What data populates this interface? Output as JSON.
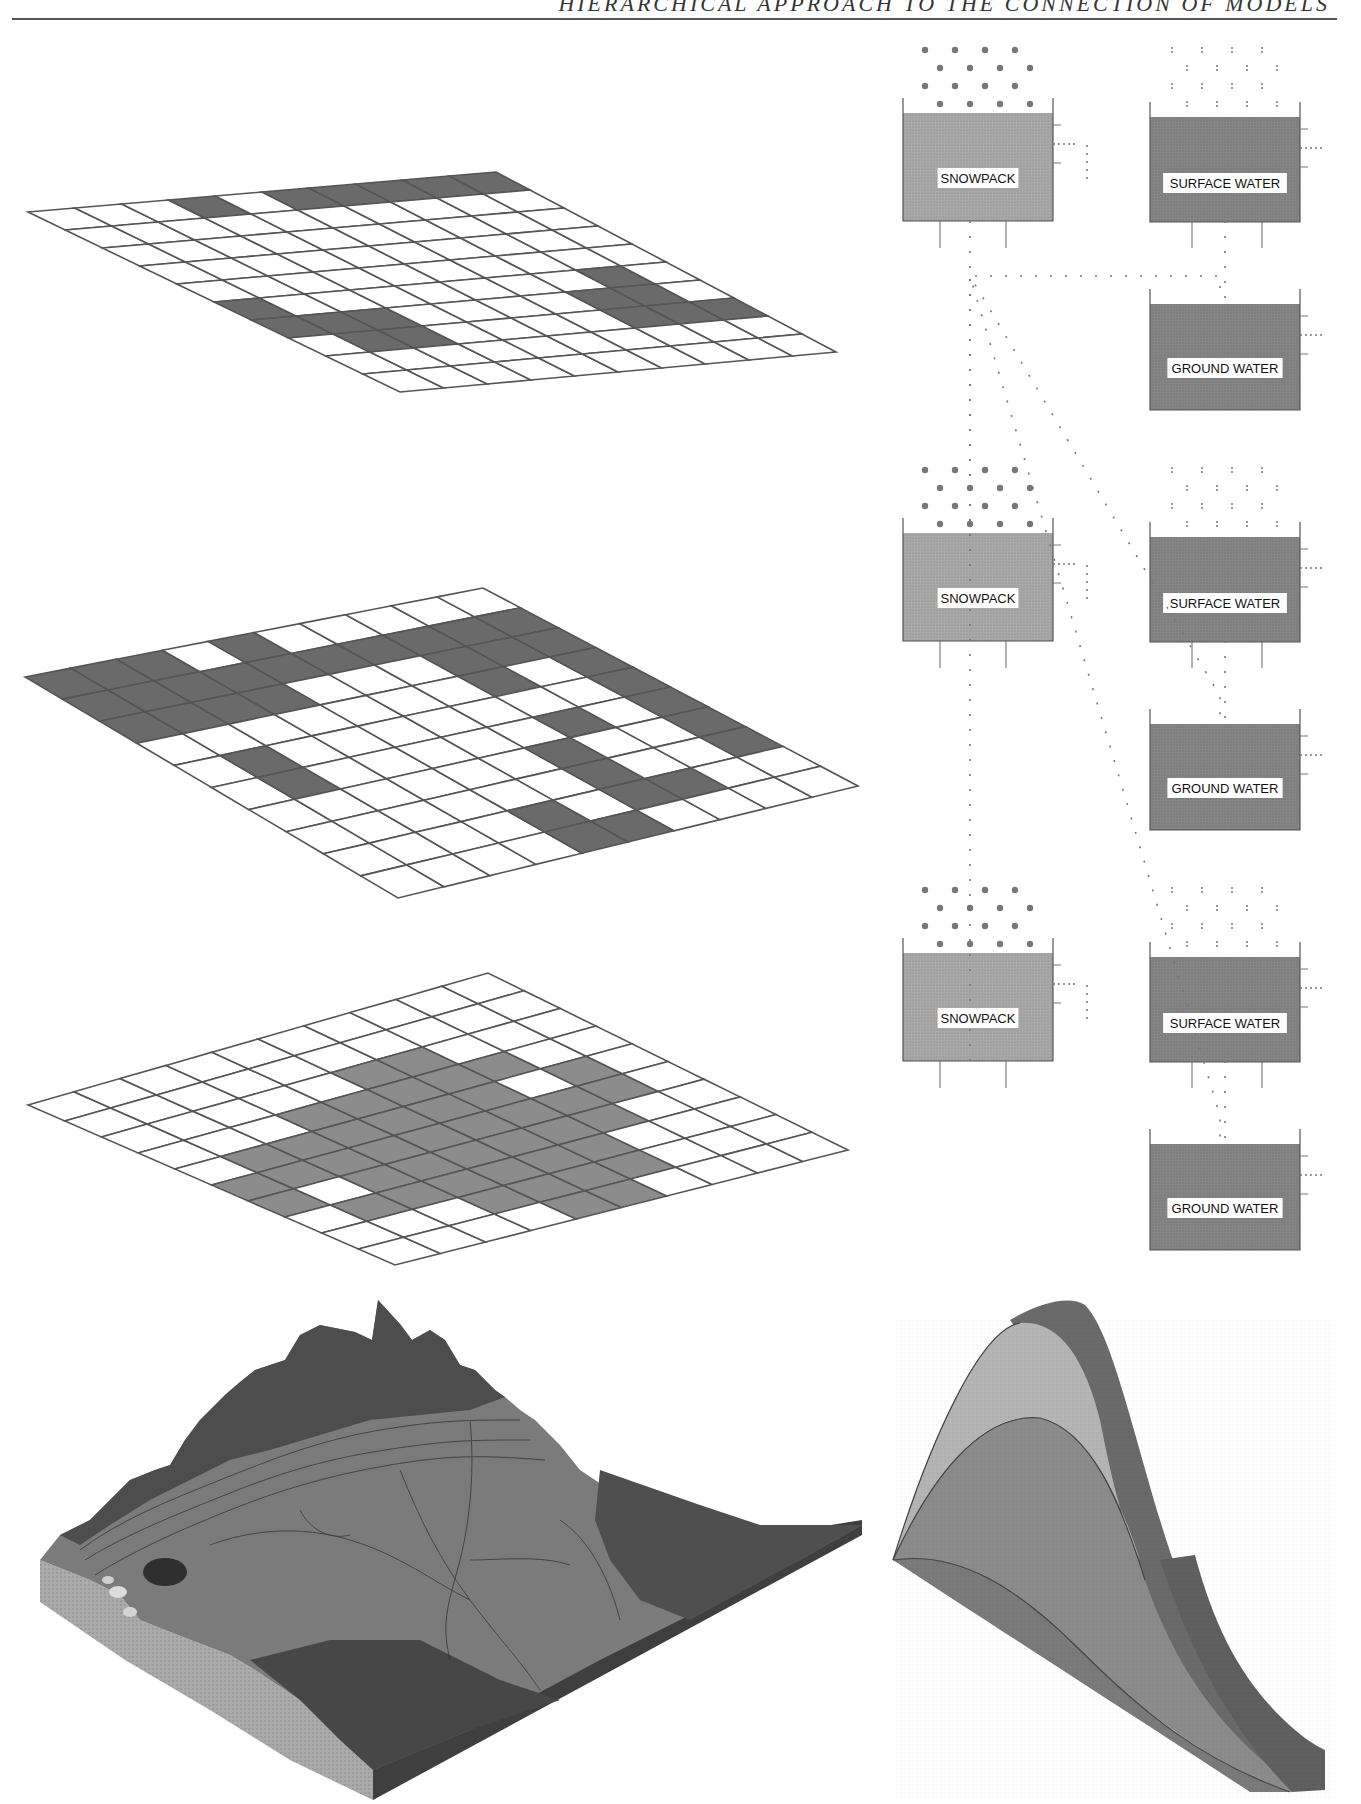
{
  "header": {
    "running_title": "HIERARCHICAL APPROACH TO THE CONNECTION OF MODELS"
  },
  "colors": {
    "grid_line": "#555555",
    "grid_dark_cell": "#6a6a6a",
    "grid_medium_cell": "#8c8c8c",
    "snowpack_fill": "#a8a8a8",
    "water_fill": "#858585",
    "terrain_dark": "#4e4e4e",
    "terrain_mid": "#7f7f7f",
    "hydro_light": "#b4b4b4",
    "hydro_mid": "#8a8a8a",
    "hydro_dark": "#6c6c6c"
  },
  "grids": [
    {
      "name": "grid-1",
      "corners": {
        "tl": [
          28,
          212
        ],
        "tr": [
          496,
          172
        ],
        "br": [
          836,
          352
        ],
        "bl": [
          400,
          392
        ]
      },
      "cells": [
        [
          0,
          0,
          0,
          1,
          0,
          1,
          1,
          1,
          1,
          1
        ],
        [
          0,
          0,
          0,
          0,
          0,
          0,
          0,
          0,
          0,
          0
        ],
        [
          0,
          0,
          0,
          0,
          0,
          0,
          0,
          0,
          0,
          0
        ],
        [
          0,
          0,
          0,
          0,
          0,
          0,
          0,
          0,
          0,
          0
        ],
        [
          0,
          0,
          0,
          0,
          0,
          0,
          0,
          0,
          0,
          0
        ],
        [
          1,
          0,
          0,
          0,
          0,
          0,
          0,
          0,
          1,
          0
        ],
        [
          1,
          1,
          1,
          0,
          0,
          0,
          0,
          1,
          1,
          0
        ],
        [
          0,
          1,
          1,
          0,
          0,
          0,
          0,
          1,
          1,
          1
        ],
        [
          0,
          0,
          0,
          0,
          0,
          0,
          0,
          0,
          0,
          0
        ],
        [
          0,
          0,
          0,
          0,
          0,
          0,
          0,
          0,
          0,
          0
        ]
      ],
      "fill_key": "grid_dark_cell"
    },
    {
      "name": "grid-2",
      "corners": {
        "tl": [
          25,
          677
        ],
        "tr": [
          483,
          588
        ],
        "br": [
          858,
          786
        ],
        "bl": [
          398,
          898
        ]
      },
      "cells": [
        [
          1,
          1,
          1,
          0,
          1,
          0,
          0,
          0,
          0,
          0
        ],
        [
          1,
          1,
          1,
          1,
          1,
          1,
          1,
          1,
          1,
          1
        ],
        [
          1,
          1,
          1,
          1,
          0,
          0,
          0,
          1,
          1,
          1
        ],
        [
          0,
          0,
          0,
          0,
          0,
          0,
          0,
          1,
          0,
          1
        ],
        [
          0,
          1,
          0,
          0,
          0,
          0,
          0,
          0,
          0,
          1
        ],
        [
          0,
          1,
          0,
          0,
          0,
          0,
          0,
          1,
          0,
          1
        ],
        [
          0,
          0,
          0,
          0,
          0,
          0,
          1,
          0,
          0,
          1
        ],
        [
          0,
          0,
          0,
          0,
          0,
          0,
          1,
          0,
          0,
          1
        ],
        [
          0,
          0,
          0,
          0,
          1,
          0,
          1,
          1,
          0,
          0
        ],
        [
          0,
          0,
          0,
          0,
          1,
          1,
          0,
          0,
          0,
          0
        ]
      ],
      "fill_key": "grid_dark_cell"
    },
    {
      "name": "grid-3",
      "corners": {
        "tl": [
          28,
          1105
        ],
        "tr": [
          488,
          973
        ],
        "br": [
          848,
          1150
        ],
        "bl": [
          395,
          1265
        ]
      },
      "cells": [
        [
          0,
          0,
          0,
          0,
          0,
          0,
          0,
          0,
          0,
          0
        ],
        [
          0,
          0,
          0,
          0,
          0,
          0,
          0,
          0,
          0,
          0
        ],
        [
          0,
          0,
          0,
          0,
          0,
          1,
          1,
          0,
          0,
          0
        ],
        [
          0,
          0,
          0,
          1,
          1,
          1,
          1,
          1,
          0,
          0
        ],
        [
          0,
          1,
          1,
          1,
          1,
          1,
          1,
          0,
          1,
          0
        ],
        [
          1,
          1,
          1,
          1,
          1,
          1,
          1,
          1,
          1,
          0
        ],
        [
          1,
          0,
          1,
          1,
          1,
          1,
          1,
          1,
          0,
          0
        ],
        [
          0,
          1,
          1,
          1,
          1,
          1,
          1,
          0,
          0,
          0
        ],
        [
          0,
          0,
          0,
          1,
          1,
          1,
          1,
          0,
          0,
          0
        ],
        [
          0,
          0,
          0,
          0,
          1,
          1,
          0,
          0,
          0,
          0
        ]
      ],
      "fill_key": "grid_medium_cell"
    }
  ],
  "box_models": [
    {
      "name": "box-model-1",
      "offset_y": 0,
      "snowpack": {
        "label": "SNOWPACK"
      },
      "surface_water": {
        "label": "SURFACE WATER"
      },
      "ground_water": {
        "label": "GROUND WATER"
      }
    },
    {
      "name": "box-model-2",
      "offset_y": 420,
      "snowpack": {
        "label": "SNOWPACK"
      },
      "surface_water": {
        "label": "SURFACE WATER"
      },
      "ground_water": {
        "label": "GROUND WATER"
      }
    },
    {
      "name": "box-model-3",
      "offset_y": 840,
      "snowpack": {
        "label": "SNOWPACK"
      },
      "surface_water": {
        "label": "SURFACE WATER"
      },
      "ground_water": {
        "label": "GROUND WATER"
      }
    }
  ],
  "terrain_block": {
    "name": "terrain-block"
  },
  "hydrograph": {
    "name": "stacked-hydrograph",
    "layers": [
      "snowpack",
      "surface water",
      "ground water"
    ]
  }
}
